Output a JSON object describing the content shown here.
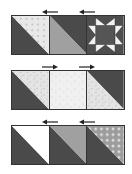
{
  "diagram": {
    "title": "",
    "colors": {
      "dark": "#4a4a4a",
      "medium": "#9a9a9a",
      "light": "#e6e6e6",
      "white": "#ffffff",
      "outline": "#333333"
    },
    "rows": [
      {
        "id": "row-1",
        "press_direction": "left",
        "blocks": [
          {
            "type": "half-square-triangle",
            "dark": "bottom-left",
            "light_fabric": "dotted-light"
          },
          {
            "type": "half-square-triangle",
            "dark": "top-right",
            "light_fabric": "medium-gray"
          },
          {
            "type": "sawtooth-star",
            "center": "dark",
            "points": "white"
          }
        ]
      },
      {
        "id": "row-2",
        "press_direction": "right",
        "blocks": [
          {
            "type": "half-square-triangle",
            "dark": "bottom-left",
            "light_fabric": "textured-light"
          },
          {
            "type": "plain-square",
            "fabric": "speckled-light"
          },
          {
            "type": "half-square-triangle",
            "dark": "top-right",
            "light_fabric": "textured-light"
          }
        ]
      },
      {
        "id": "row-3",
        "press_direction": "left",
        "blocks": [
          {
            "type": "half-square-triangle",
            "dark": "bottom-left",
            "light_fabric": "white"
          },
          {
            "type": "half-square-triangle",
            "dark": "bottom-left",
            "light_fabric": "medium-gray"
          },
          {
            "type": "half-square-triangle",
            "dark": "bottom-left",
            "light_fabric": "dotted-medium"
          }
        ]
      }
    ]
  }
}
